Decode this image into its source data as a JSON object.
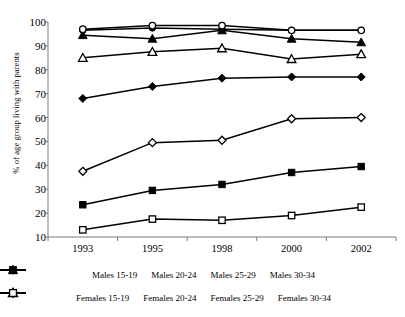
{
  "chart_data": {
    "type": "line",
    "title": "",
    "xlabel": "",
    "ylabel": "% of age group living with parents",
    "categories": [
      "1993",
      "1995",
      "1998",
      "2000",
      "2002"
    ],
    "ylim": [
      10,
      100
    ],
    "yticks": [
      10,
      20,
      30,
      40,
      50,
      60,
      70,
      80,
      90,
      100
    ],
    "grid": false,
    "legend_position": "bottom",
    "series": [
      {
        "name": "Males 15-19",
        "marker": "filled-circle",
        "values": [
          96.5,
          97.5,
          97.0,
          96.5,
          96.5
        ]
      },
      {
        "name": "Males 20-24",
        "marker": "filled-triangle",
        "values": [
          94.5,
          93.0,
          96.5,
          93.0,
          91.5
        ]
      },
      {
        "name": "Males 25-29",
        "marker": "filled-diamond",
        "values": [
          68.0,
          73.0,
          76.5,
          77.0,
          77.0
        ]
      },
      {
        "name": "Males 30-34",
        "marker": "filled-square",
        "values": [
          23.5,
          29.5,
          32.0,
          37.0,
          39.5
        ]
      },
      {
        "name": "Females 15-19",
        "marker": "hollow-circle",
        "values": [
          97.0,
          98.5,
          98.5,
          96.5,
          96.5
        ]
      },
      {
        "name": "Females 20-24",
        "marker": "hollow-triangle",
        "values": [
          85.0,
          87.5,
          89.0,
          84.5,
          86.5
        ]
      },
      {
        "name": "Females 25-29",
        "marker": "hollow-diamond",
        "values": [
          37.5,
          49.5,
          50.5,
          59.5,
          60.0
        ]
      },
      {
        "name": "Females 30-34",
        "marker": "hollow-square",
        "values": [
          13.0,
          17.5,
          17.0,
          19.0,
          22.5
        ]
      }
    ]
  },
  "colors": {
    "line": "#000000",
    "axis": "#7a7a7a",
    "background": "#ffffff"
  }
}
